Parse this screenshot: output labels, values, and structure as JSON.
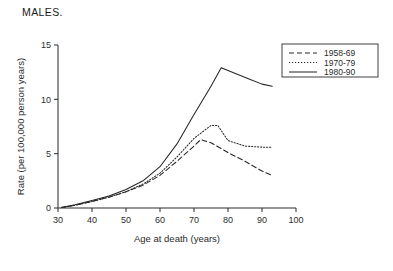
{
  "title": "MALES.",
  "chart_data": {
    "type": "line",
    "title": "MALES.",
    "xlabel": "Age at death (years)",
    "ylabel": "Rate (per 100,000 person years)",
    "xlim": [
      30,
      100
    ],
    "ylim": [
      0,
      15
    ],
    "xticks": [
      30,
      40,
      50,
      60,
      70,
      80,
      90,
      100
    ],
    "yticks": [
      0,
      5,
      10,
      15
    ],
    "grid": false,
    "legend_position": "top-right",
    "series": [
      {
        "name": "1958-69",
        "style": "dashed",
        "color": "#262626",
        "x": [
          31,
          35,
          40,
          45,
          50,
          55,
          60,
          65,
          70,
          72,
          75,
          80,
          85,
          90,
          93
        ],
        "y": [
          0.05,
          0.25,
          0.6,
          1.0,
          1.5,
          2.1,
          3.0,
          4.3,
          5.7,
          6.3,
          6.0,
          5.1,
          4.3,
          3.4,
          3.0
        ]
      },
      {
        "name": "1970-79",
        "style": "dotted",
        "color": "#262626",
        "x": [
          31,
          35,
          40,
          45,
          50,
          55,
          60,
          65,
          70,
          75,
          77,
          80,
          85,
          90,
          93
        ],
        "y": [
          0.05,
          0.25,
          0.6,
          1.0,
          1.5,
          2.2,
          3.2,
          4.7,
          6.4,
          7.6,
          7.6,
          6.2,
          5.7,
          5.6,
          5.6
        ]
      },
      {
        "name": "1980-90",
        "style": "solid",
        "color": "#262626",
        "x": [
          31,
          35,
          40,
          45,
          50,
          55,
          60,
          65,
          70,
          75,
          78,
          82,
          86,
          90,
          93
        ],
        "y": [
          0.05,
          0.3,
          0.7,
          1.1,
          1.7,
          2.5,
          3.8,
          5.9,
          8.6,
          11.2,
          12.9,
          12.4,
          11.9,
          11.4,
          11.2
        ]
      }
    ]
  },
  "legend": {
    "entries": [
      {
        "label": "1958-69",
        "style": "dashed"
      },
      {
        "label": "1970-79",
        "style": "dotted"
      },
      {
        "label": "1980-90",
        "style": "solid"
      }
    ]
  }
}
